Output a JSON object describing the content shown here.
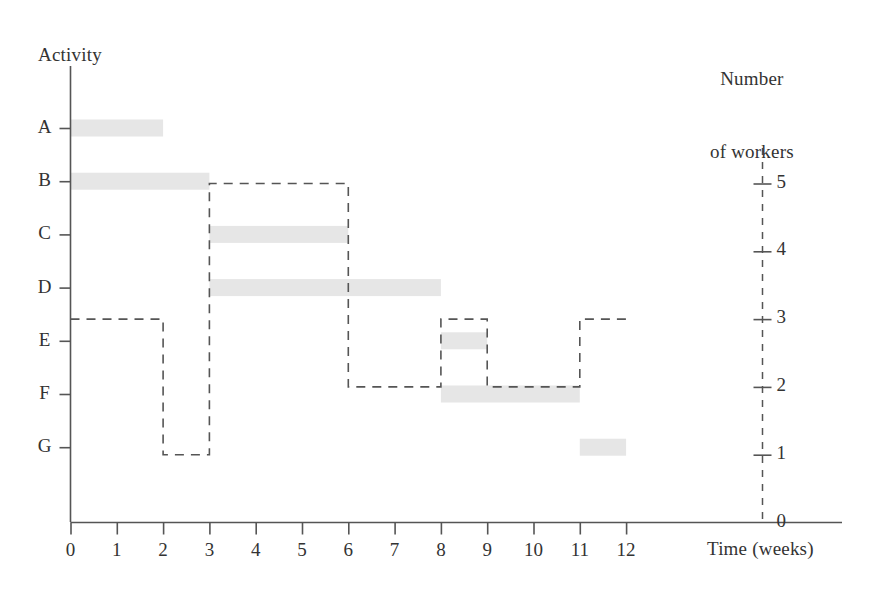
{
  "labels": {
    "activity_axis": "Activity",
    "workers_axis_line1": "Number",
    "workers_axis_line2": "of workers",
    "time_axis": "Time (weeks)"
  },
  "colors": {
    "bar_fill": "#e6e6e6",
    "dashed_line": "#555555",
    "axis_line": "#555555",
    "text": "#333333",
    "background": "#ffffff"
  },
  "chart_data": {
    "type": "bar",
    "title": "",
    "subtitle": "",
    "xlabel": "Time (weeks)",
    "ylabel": "Activity",
    "y2label": "Number of workers",
    "xlim": [
      0,
      12
    ],
    "ylim_workers": [
      0,
      5
    ],
    "grid": false,
    "legend": "none",
    "x_ticks": [
      "0",
      "1",
      "2",
      "3",
      "4",
      "5",
      "6",
      "7",
      "8",
      "9",
      "10",
      "11",
      "12"
    ],
    "activity_ticks": [
      "A",
      "B",
      "C",
      "D",
      "E",
      "F",
      "G"
    ],
    "worker_ticks": [
      "5",
      "4",
      "3",
      "2",
      "1",
      "0"
    ],
    "activities": [
      {
        "name": "A",
        "start": 0,
        "end": 2,
        "duration": 2
      },
      {
        "name": "B",
        "start": 0,
        "end": 3,
        "duration": 3
      },
      {
        "name": "C",
        "start": 3,
        "end": 6,
        "duration": 3
      },
      {
        "name": "D",
        "start": 3,
        "end": 8,
        "duration": 5
      },
      {
        "name": "E",
        "start": 8,
        "end": 9,
        "duration": 1
      },
      {
        "name": "F",
        "start": 8,
        "end": 11,
        "duration": 3
      },
      {
        "name": "G",
        "start": 11,
        "end": 12,
        "duration": 1
      }
    ],
    "workers_histogram": {
      "style": "dashed-step",
      "steps": [
        {
          "start": 0,
          "end": 2,
          "workers": 3
        },
        {
          "start": 2,
          "end": 3,
          "workers": 1
        },
        {
          "start": 3,
          "end": 6,
          "workers": 5
        },
        {
          "start": 6,
          "end": 8,
          "workers": 2
        },
        {
          "start": 8,
          "end": 9,
          "workers": 3
        },
        {
          "start": 9,
          "end": 11,
          "workers": 2
        },
        {
          "start": 11,
          "end": 12,
          "workers": 3
        }
      ]
    }
  }
}
